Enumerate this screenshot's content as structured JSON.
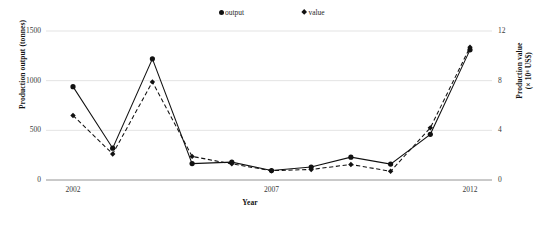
{
  "chart_data": {
    "type": "line",
    "title": "",
    "xlabel": "Year",
    "ylabel": "Production output (tonnes)",
    "ylabel_right_line1": "Production value",
    "ylabel_right_line2": "(× 10⁶ US$)",
    "x": [
      2002,
      2003,
      2004,
      2005,
      2006,
      2007,
      2008,
      2009,
      2010,
      2011,
      2012
    ],
    "xticks": [
      "2002",
      "2007",
      "2012"
    ],
    "xtick_values": [
      2002,
      2007,
      2012
    ],
    "yticks_left": [
      "0",
      "500",
      "1000",
      "1500"
    ],
    "ytick_values_left": [
      0,
      500,
      1000,
      1500
    ],
    "ylim_left": [
      0,
      1500
    ],
    "yticks_right": [
      "0",
      "4",
      "8",
      "12"
    ],
    "ytick_values_right": [
      0,
      4,
      8,
      12
    ],
    "ylim_right": [
      0,
      12
    ],
    "grid": true,
    "legend_position": "top-center",
    "series": [
      {
        "name": "output",
        "axis": "left",
        "marker": "circle",
        "linestyle": "solid",
        "color": "#111111",
        "values": [
          940,
          320,
          1220,
          165,
          180,
          95,
          130,
          230,
          160,
          460,
          1310
        ]
      },
      {
        "name": "value",
        "axis": "right",
        "marker": "diamond",
        "linestyle": "dashed",
        "color": "#111111",
        "values": [
          5.2,
          2.1,
          7.9,
          1.9,
          1.3,
          0.75,
          0.85,
          1.25,
          0.7,
          4.2,
          10.7
        ]
      }
    ]
  },
  "legend": {
    "output_label": "output",
    "value_label": "value"
  },
  "caption": ""
}
